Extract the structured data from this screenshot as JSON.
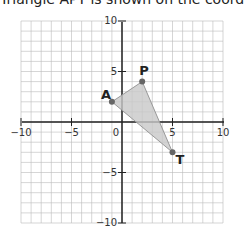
{
  "header": {
    "text": "Triangle APT is shown on the coordinate plane."
  },
  "graph": {
    "x_range": [
      -10,
      10
    ],
    "y_range": [
      -10,
      10
    ],
    "grid_step": 1,
    "x_ticks": [
      "−10",
      "−5",
      "5",
      "10"
    ],
    "y_ticks": [
      "10",
      "5",
      "−5",
      "−10"
    ],
    "origin_label": "0",
    "colors": {
      "grid": "#bbbbbb",
      "axis": "#222222",
      "fill": "#cccccc",
      "point": "#666666"
    }
  },
  "chart_data": {
    "type": "scatter",
    "title": "",
    "xlabel": "",
    "ylabel": "",
    "xlim": [
      -10,
      10
    ],
    "ylim": [
      -10,
      10
    ],
    "grid": true,
    "points": [
      {
        "label": "A",
        "x": -1,
        "y": 2
      },
      {
        "label": "P",
        "x": 2,
        "y": 4
      },
      {
        "label": "T",
        "x": 5,
        "y": -3
      }
    ],
    "polygon": [
      "A",
      "P",
      "T"
    ]
  },
  "points": {
    "A": {
      "label": "A"
    },
    "P": {
      "label": "P"
    },
    "T": {
      "label": "T"
    }
  }
}
